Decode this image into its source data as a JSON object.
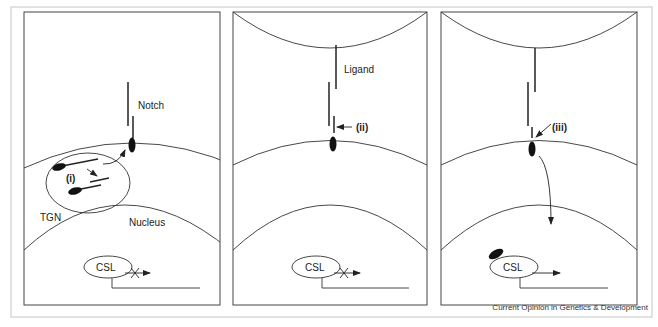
{
  "figure": {
    "caption": "Current Opinion in Genetics & Development",
    "colors": {
      "line": "#333333",
      "frame": "#bbbbbb",
      "fill": "#111111",
      "background": "#ffffff"
    }
  },
  "panels": [
    {
      "id": "panel-1",
      "labels": {
        "receptor": "Notch",
        "compartment": "TGN",
        "step": "(i)",
        "nucleus": "Nucleus",
        "factor": "CSL"
      },
      "transcription": "blocked"
    },
    {
      "id": "panel-2",
      "labels": {
        "ligand": "Ligand",
        "step": "(ii)",
        "factor": "CSL"
      },
      "transcription": "blocked"
    },
    {
      "id": "panel-3",
      "labels": {
        "step": "(iii)",
        "factor": "CSL"
      },
      "transcription": "active"
    }
  ]
}
